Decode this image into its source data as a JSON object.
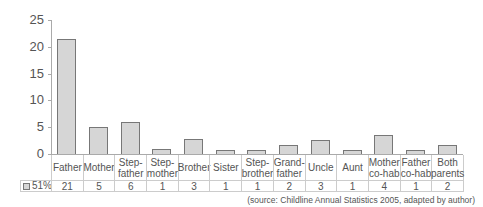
{
  "chart_data": {
    "type": "bar",
    "title": "",
    "xlabel": "",
    "ylabel": "",
    "ylim": [
      0,
      25
    ],
    "yticks": [
      0,
      5,
      10,
      15,
      20,
      25
    ],
    "grid": false,
    "legend": {
      "position": "table-left",
      "entries": [
        "51%"
      ]
    },
    "categories": [
      "Father",
      "Mother",
      "Step-\nfather",
      "Step-\nmother",
      "Brother",
      "Sister",
      "Step-\nbrother",
      "Grand-\nfather",
      "Uncle",
      "Aunt",
      "Mother\nco-hab",
      "Father\nco-hab",
      "Both\nparents"
    ],
    "series": [
      {
        "name": "51%",
        "values": [
          21,
          5,
          6,
          1,
          3,
          1,
          1,
          2,
          3,
          1,
          4,
          1,
          2
        ],
        "bar_heights": [
          21.5,
          5,
          5.9,
          0.9,
          2.8,
          0.8,
          0.8,
          1.7,
          2.7,
          0.7,
          3.6,
          0.7,
          1.6
        ]
      }
    ],
    "source": "(source: Childline Annual Statistics 2005, adapted by author)"
  },
  "colors": {
    "bar_fill": "#d6d6d6",
    "bar_stroke": "#777777"
  }
}
